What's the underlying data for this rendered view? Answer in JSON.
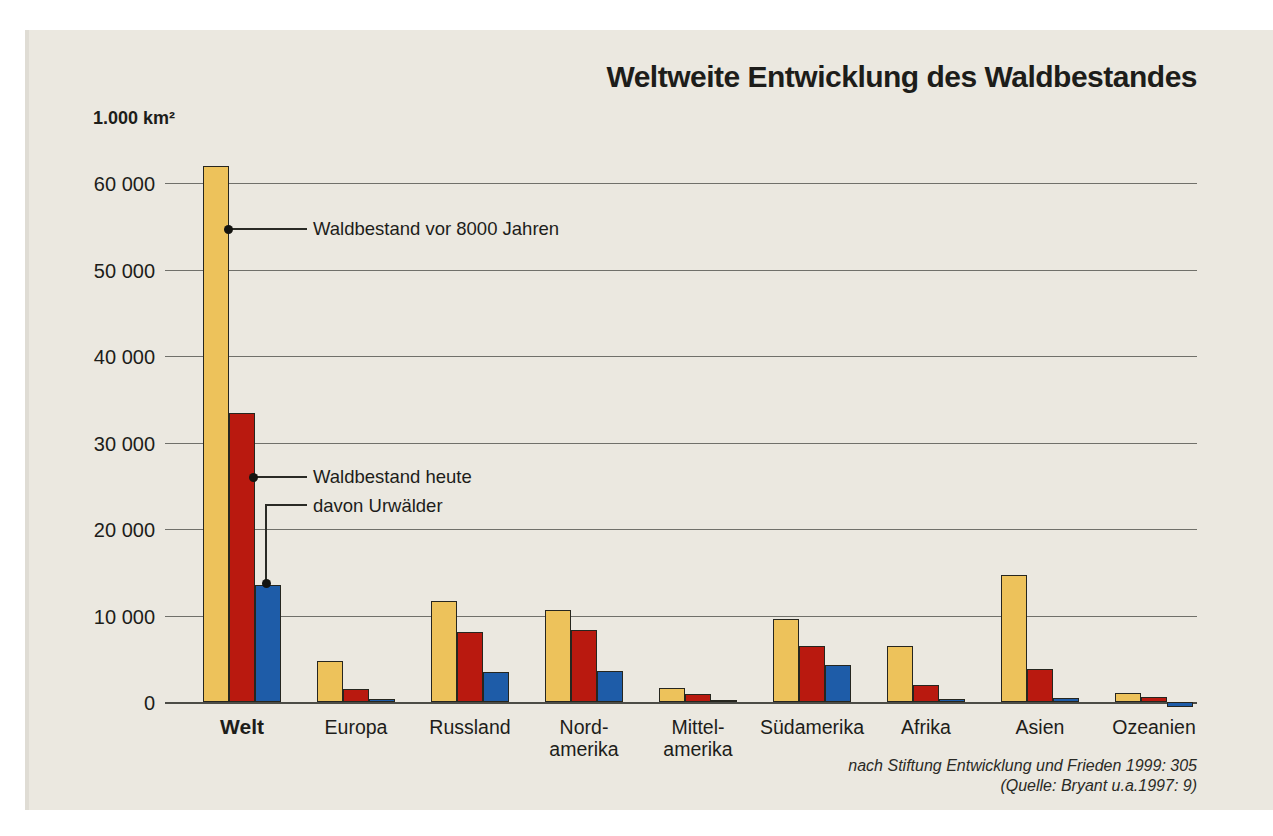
{
  "page": {
    "background_color": "#ffffff",
    "panel_color": "#ebe8e0"
  },
  "title": "Weltweite Entwicklung des Waldbestandes",
  "unit_label": "1.000 km²",
  "annotations": {
    "ancient_label": "Waldbestand vor 8000 Jahren",
    "today_label": "Waldbestand heute",
    "primeval_label": "davon Urwälder"
  },
  "source": {
    "line1": "nach Stiftung Entwicklung und Frieden 1999: 305",
    "line2": "(Quelle: Bryant u.a.1997: 9)"
  },
  "colors": {
    "ancient_bar": "#edc25b",
    "today_bar": "#b9190f",
    "primeval_bar": "#1e5ca8",
    "gridline": "#70706a",
    "text": "#1d1d1a"
  },
  "chart_data": {
    "type": "bar",
    "title": "Weltweite Entwicklung des Waldbestandes",
    "ylabel": "1.000 km²",
    "ylim": [
      0,
      62500
    ],
    "grid": "horizontal",
    "legend_position": "inline-annotations",
    "ticks": [
      {
        "value": 60000,
        "label": "60 000"
      },
      {
        "value": 50000,
        "label": "50 000"
      },
      {
        "value": 40000,
        "label": "40 000"
      },
      {
        "value": 30000,
        "label": "30 000"
      },
      {
        "value": 20000,
        "label": "20 000"
      },
      {
        "value": 10000,
        "label": "10 000"
      },
      {
        "value": 0,
        "label": "0"
      }
    ],
    "categories": [
      {
        "label": "Welt",
        "lines": [
          "Welt"
        ],
        "bold": true
      },
      {
        "label": "Europa",
        "lines": [
          "Europa"
        ],
        "bold": false
      },
      {
        "label": "Russland",
        "lines": [
          "Russland"
        ],
        "bold": false
      },
      {
        "label": "Nordamerika",
        "lines": [
          "Nord-",
          "amerika"
        ],
        "bold": false
      },
      {
        "label": "Mittelamerika",
        "lines": [
          "Mittel-",
          "amerika"
        ],
        "bold": false
      },
      {
        "label": "Südamerika",
        "lines": [
          "Südamerika"
        ],
        "bold": false
      },
      {
        "label": "Afrika",
        "lines": [
          "Afrika"
        ],
        "bold": false
      },
      {
        "label": "Asien",
        "lines": [
          "Asien"
        ],
        "bold": false
      },
      {
        "label": "Ozeanien",
        "lines": [
          "Ozeanien"
        ],
        "bold": false
      }
    ],
    "series": [
      {
        "name": "Waldbestand vor 8000 Jahren",
        "color": "#edc25b",
        "values": [
          62000,
          4700,
          11700,
          10600,
          1600,
          9600,
          6500,
          14700,
          1050
        ]
      },
      {
        "name": "Waldbestand heute",
        "color": "#b9190f",
        "values": [
          33400,
          1500,
          8100,
          8300,
          900,
          6500,
          2000,
          3800,
          550
        ]
      },
      {
        "name": "davon Urwälder",
        "color": "#1e5ca8",
        "values": [
          13500,
          300,
          3500,
          3600,
          150,
          4300,
          350,
          500,
          300
        ]
      }
    ],
    "quirks": [
      {
        "category_index": 8,
        "series_index": 2,
        "render": "below-baseline",
        "note": "Ozeanien primeval-forest bar is printed hanging below the zero line in the original"
      }
    ]
  }
}
